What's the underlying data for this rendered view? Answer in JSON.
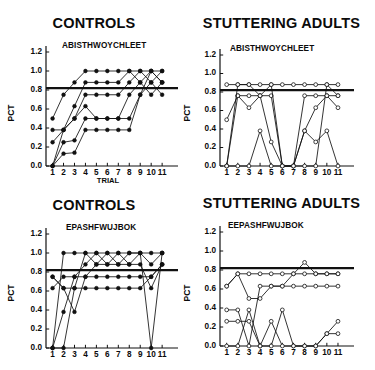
{
  "figure": {
    "width": 375,
    "height": 370,
    "background": "#ffffff",
    "ink": "#111111"
  },
  "chart_data": [
    {
      "id": "top-left",
      "type": "line",
      "title": "CONTROLS",
      "subtitle": "ABISTHWOYCHLEET",
      "xlabel": "TRIAL",
      "ylabel": "PCT",
      "marker": "filled-circle",
      "grid": false,
      "legend": "none",
      "xlim": [
        0.4,
        11.9
      ],
      "ylim": [
        0.0,
        1.2
      ],
      "yticks": [
        "0.0",
        "0.2",
        "0.4",
        "0.6",
        "0.8",
        "1.0",
        "1.2"
      ],
      "ytick_values": [
        0.0,
        0.2,
        0.4,
        0.6,
        0.8,
        1.0,
        1.2
      ],
      "xticks": [
        "1",
        "2",
        "3",
        "4",
        "5",
        "6",
        "7",
        "8",
        "9",
        "10",
        "11"
      ],
      "xtick_values": [
        1,
        2,
        3,
        4,
        5,
        6,
        7,
        8,
        9,
        10,
        11
      ],
      "criterion_line": 0.82,
      "x": [
        1,
        2,
        3,
        4,
        5,
        6,
        7,
        8,
        9,
        10,
        11
      ],
      "series": [
        {
          "name": "S1",
          "values": [
            0.5,
            0.75,
            0.88,
            1.0,
            1.0,
            1.0,
            1.0,
            1.0,
            1.0,
            1.0,
            1.0
          ]
        },
        {
          "name": "S2",
          "values": [
            0.38,
            0.38,
            0.63,
            0.88,
            0.88,
            0.88,
            0.88,
            1.0,
            0.88,
            1.0,
            0.88
          ]
        },
        {
          "name": "S3",
          "values": [
            0.25,
            0.38,
            0.5,
            0.75,
            0.75,
            0.75,
            0.75,
            0.88,
            1.0,
            0.88,
            1.0
          ]
        },
        {
          "name": "S4",
          "values": [
            0.0,
            0.25,
            0.27,
            0.5,
            0.5,
            0.5,
            0.5,
            0.75,
            0.88,
            0.75,
            0.88
          ]
        },
        {
          "name": "S5",
          "values": [
            0.0,
            0.13,
            0.14,
            0.38,
            0.38,
            0.38,
            0.38,
            0.38,
            0.75,
            0.88,
            0.75
          ]
        },
        {
          "name": "S6",
          "values": [
            0.0,
            0.38,
            0.5,
            0.63,
            0.5,
            0.5,
            0.5,
            0.5,
            0.75,
            1.0,
            0.88
          ]
        }
      ]
    },
    {
      "id": "top-right",
      "type": "line",
      "title": "STUTTERING ADULTS",
      "subtitle": "ABISTHWOYCHLEET",
      "xlabel": "",
      "ylabel": "PCT",
      "marker": "open-circle",
      "grid": false,
      "legend": "none",
      "xlim": [
        0.4,
        11.9
      ],
      "ylim": [
        0.0,
        1.2
      ],
      "yticks": [
        "0.0",
        "0.2",
        "0.4",
        "0.6",
        "0.8",
        "1.0",
        "1.2"
      ],
      "ytick_values": [
        0.0,
        0.2,
        0.4,
        0.6,
        0.8,
        1.0,
        1.2
      ],
      "xticks": [
        "1",
        "2",
        "3",
        "4",
        "5",
        "6",
        "7",
        "8",
        "9",
        "10",
        "11"
      ],
      "xtick_values": [
        1,
        2,
        3,
        4,
        5,
        6,
        7,
        8,
        9,
        10,
        11
      ],
      "criterion_line": 0.82,
      "x": [
        1,
        2,
        3,
        4,
        5,
        6,
        7,
        8,
        9,
        10,
        11
      ],
      "series": [
        {
          "name": "S1",
          "values": [
            0.88,
            0.88,
            0.88,
            0.88,
            0.88,
            0.88,
            0.88,
            0.88,
            0.88,
            0.88,
            0.88
          ]
        },
        {
          "name": "S2",
          "values": [
            0.5,
            0.76,
            0.76,
            0.76,
            0.76,
            0.0,
            0.0,
            0.76,
            0.76,
            0.76,
            0.76
          ]
        },
        {
          "name": "S3",
          "values": [
            0.0,
            0.76,
            0.63,
            0.76,
            0.88,
            0.0,
            0.0,
            0.0,
            0.0,
            0.88,
            0.76
          ]
        },
        {
          "name": "S4",
          "values": [
            0.0,
            0.88,
            0.88,
            0.76,
            0.26,
            0.0,
            0.0,
            0.38,
            0.63,
            0.76,
            0.63
          ]
        },
        {
          "name": "S5",
          "values": [
            0.0,
            0.0,
            0.0,
            0.38,
            0.0,
            0.0,
            0.0,
            0.38,
            0.26,
            0.38,
            0.0
          ]
        }
      ]
    },
    {
      "id": "bottom-left",
      "type": "line",
      "title": "CONTROLS",
      "subtitle": "EPASHFWUJBOK",
      "xlabel": "",
      "ylabel": "PCT",
      "marker": "filled-circle",
      "grid": false,
      "legend": "none",
      "xlim": [
        0.4,
        11.9
      ],
      "ylim": [
        0.0,
        1.2
      ],
      "yticks": [
        "0.0",
        "0.2",
        "0.4",
        "0.6",
        "0.8",
        "1.0",
        "1.2"
      ],
      "ytick_values": [
        0.0,
        0.2,
        0.4,
        0.6,
        0.8,
        1.0,
        1.2
      ],
      "xticks": [
        "1",
        "2",
        "3",
        "4",
        "5",
        "6",
        "7",
        "8",
        "9",
        "10",
        "11"
      ],
      "xtick_values": [
        1,
        2,
        3,
        4,
        5,
        6,
        7,
        8,
        9,
        10,
        11
      ],
      "criterion_line": 0.82,
      "x": [
        1,
        2,
        3,
        4,
        5,
        6,
        7,
        8,
        9,
        10,
        11
      ],
      "series": [
        {
          "name": "S1",
          "values": [
            0.0,
            1.0,
            1.0,
            1.0,
            0.88,
            1.0,
            0.88,
            1.0,
            1.0,
            0.88,
            1.0
          ]
        },
        {
          "name": "S2",
          "values": [
            0.0,
            0.38,
            0.75,
            0.88,
            1.0,
            0.88,
            1.0,
            0.88,
            1.0,
            1.0,
            1.0
          ]
        },
        {
          "name": "S3",
          "values": [
            0.75,
            0.63,
            0.63,
            1.0,
            1.0,
            1.0,
            1.0,
            1.0,
            1.0,
            0.0,
            1.0
          ]
        },
        {
          "name": "S4",
          "values": [
            0.75,
            0.63,
            0.38,
            0.75,
            0.88,
            0.88,
            0.88,
            0.88,
            0.88,
            0.63,
            0.88
          ]
        },
        {
          "name": "S5",
          "values": [
            0.63,
            0.75,
            0.75,
            0.75,
            0.75,
            0.75,
            0.75,
            0.75,
            0.75,
            0.75,
            0.88
          ]
        },
        {
          "name": "S6",
          "values": [
            0.0,
            0.0,
            0.63,
            0.63,
            0.63,
            0.63,
            0.63,
            0.63,
            0.63,
            0.75,
            0.88
          ]
        }
      ]
    },
    {
      "id": "bottom-right",
      "type": "line",
      "title": "STUTTERING ADULTS",
      "subtitle": "EEPASHFWUJBOK",
      "xlabel": "",
      "ylabel": "PCT",
      "marker": "open-circle",
      "grid": false,
      "legend": "none",
      "xlim": [
        0.4,
        11.9
      ],
      "ylim": [
        0.0,
        1.2
      ],
      "yticks": [
        "0.0",
        "0.2",
        "0.4",
        "0.6",
        "0.8",
        "1.0",
        "1.2"
      ],
      "ytick_values": [
        0.0,
        0.2,
        0.4,
        0.6,
        0.8,
        1.0,
        1.2
      ],
      "xticks": [
        "1",
        "2",
        "3",
        "4",
        "5",
        "6",
        "7",
        "8",
        "9",
        "10",
        "11"
      ],
      "xtick_values": [
        1,
        2,
        3,
        4,
        5,
        6,
        7,
        8,
        9,
        10,
        11
      ],
      "criterion_line": 0.82,
      "x": [
        1,
        2,
        3,
        4,
        5,
        6,
        7,
        8,
        9,
        10,
        11
      ],
      "series": [
        {
          "name": "S1",
          "values": [
            0.63,
            0.76,
            0.76,
            0.76,
            0.76,
            0.76,
            0.76,
            0.88,
            0.76,
            0.76,
            0.76
          ]
        },
        {
          "name": "S2",
          "values": [
            0.63,
            0.76,
            0.5,
            0.5,
            0.63,
            0.63,
            0.76,
            0.76,
            0.76,
            0.76,
            0.76
          ]
        },
        {
          "name": "S3",
          "values": [
            0.38,
            0.38,
            0.0,
            0.63,
            0.63,
            0.63,
            0.63,
            0.63,
            0.63,
            0.63,
            0.63
          ]
        },
        {
          "name": "S4",
          "values": [
            0.26,
            0.26,
            0.26,
            0.0,
            0.0,
            0.38,
            0.0,
            0.0,
            0.0,
            0.13,
            0.26
          ]
        },
        {
          "name": "S5",
          "values": [
            0.0,
            0.0,
            0.38,
            0.0,
            0.26,
            0.0,
            0.0,
            0.0,
            0.0,
            0.13,
            0.13
          ]
        }
      ]
    }
  ]
}
